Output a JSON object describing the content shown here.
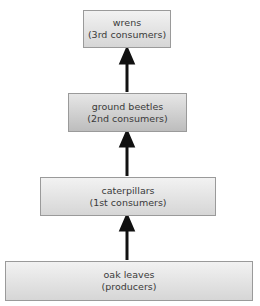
{
  "diagram": {
    "type": "food-chain",
    "levels": [
      {
        "name": "wrens",
        "role": "(3rd consumers)"
      },
      {
        "name": "ground beetles",
        "role": "(2nd consumers)"
      },
      {
        "name": "caterpillars",
        "role": "(1st consumers)"
      },
      {
        "name": "oak leaves",
        "role": "(producers)"
      }
    ],
    "arrows": [
      {
        "from": "oak leaves",
        "to": "caterpillars"
      },
      {
        "from": "caterpillars",
        "to": "ground beetles"
      },
      {
        "from": "ground beetles",
        "to": "wrens"
      }
    ]
  }
}
